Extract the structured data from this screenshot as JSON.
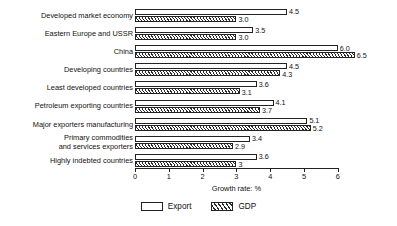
{
  "chart_data": {
    "type": "bar",
    "orientation": "horizontal",
    "title": "",
    "xlabel": "Growth rate: %",
    "ylabel": "",
    "xlim": [
      0,
      6
    ],
    "xticks": [
      "0",
      "1",
      "2",
      "3",
      "4",
      "5",
      "6"
    ],
    "grid": false,
    "legend_position": "bottom-center",
    "categories": [
      "Developed market economy",
      "Eastern Europe and USSR",
      "China",
      "Developing countries",
      "Least developed countries",
      "Petroleum exporting countries",
      "Major exporters manufacturing",
      "Primary commodities\nand services exporters",
      "Highly indebted countries"
    ],
    "series": [
      {
        "name": "Export",
        "values": [
          4.5,
          3.5,
          6.0,
          4.5,
          3.6,
          4.1,
          5.1,
          3.4,
          3.6
        ],
        "labels": [
          "4.5",
          "3.5",
          "6.0",
          "4.5",
          "3.6",
          "4.1",
          "5.1",
          "3.4",
          "3.6"
        ]
      },
      {
        "name": "GDP",
        "values": [
          3.0,
          3.0,
          6.5,
          4.3,
          3.1,
          3.7,
          5.2,
          2.9,
          3.0
        ],
        "labels": [
          "3.0",
          "3.0",
          "6.5",
          "4.3",
          "3.1",
          "3.7",
          "5.2",
          "2.9",
          "3"
        ]
      }
    ]
  },
  "legend": {
    "items": [
      {
        "label": "Export"
      },
      {
        "label": "GDP"
      }
    ]
  }
}
